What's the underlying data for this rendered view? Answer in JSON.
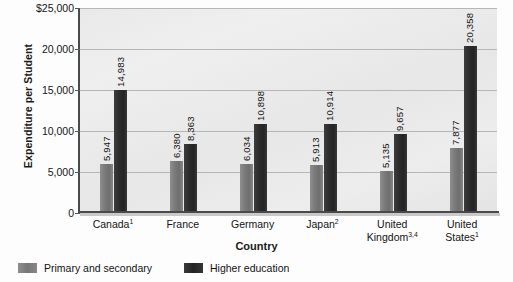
{
  "chart_data": {
    "type": "bar",
    "title": "",
    "xlabel": "Country",
    "ylabel": "Expenditure per Student",
    "categories": [
      "Canada",
      "France",
      "Germany",
      "Japan",
      "United Kingdom",
      "United States"
    ],
    "category_footnotes": [
      "1",
      "",
      "",
      "2",
      "3,4",
      "1"
    ],
    "category_labels": [
      "Canada¹",
      "France",
      "Germany",
      "Japan²",
      "United Kingdom³,⁴",
      "United States¹"
    ],
    "series": [
      {
        "name": "Primary and secondary",
        "color": "#7b7b7b",
        "values": [
          5947,
          6380,
          6034,
          5913,
          5135,
          7877
        ],
        "value_labels": [
          "5,947",
          "6,380",
          "6,034",
          "5,913",
          "5,135",
          "7,877"
        ]
      },
      {
        "name": "Higher education",
        "color": "#2c2c2c",
        "values": [
          14983,
          8363,
          10898,
          10914,
          9657,
          20358
        ],
        "value_labels": [
          "14,983",
          "8,363",
          "10,898",
          "10,914",
          "9,657",
          "20,358"
        ]
      }
    ],
    "ylim": [
      0,
      25000
    ],
    "ytick_values": [
      0,
      5000,
      10000,
      15000,
      20000,
      25000
    ],
    "ytick_labels": [
      "0",
      "5,000",
      "10,000",
      "15,000",
      "20,000",
      "$25,000"
    ],
    "grid": true,
    "legend_position": "bottom-left",
    "plot_background": "#e9e9e9"
  }
}
